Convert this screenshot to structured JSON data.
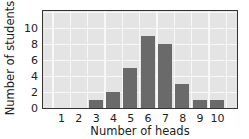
{
  "chart_data": {
    "type": "bar",
    "title": "",
    "xlabel": "Number of heads",
    "ylabel": "Number of students",
    "categories": [
      "1",
      "2",
      "3",
      "4",
      "5",
      "6",
      "7",
      "8",
      "9",
      "10"
    ],
    "values": [
      0,
      0,
      1,
      2,
      5,
      9,
      8,
      3,
      1,
      1
    ],
    "ylim": [
      0,
      12
    ],
    "yticks": [
      "0",
      "2",
      "4",
      "6",
      "8",
      "10"
    ],
    "grid": true,
    "legend": null,
    "colors": {
      "bar": "#6a6a6a",
      "plot_background": "#e4e4e4",
      "grid": "#f7f7f7",
      "frame": "#333333"
    }
  }
}
